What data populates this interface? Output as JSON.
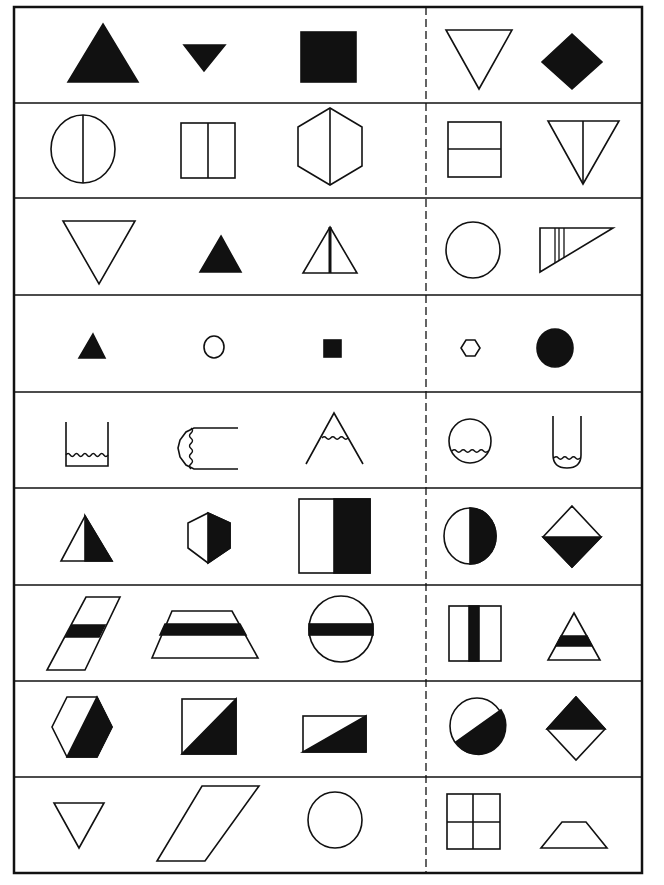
{
  "ink_color": "#111111",
  "paper_color": "#ffffff",
  "divider": {
    "style": "dashed",
    "separates": "group-of-three from group-of-two"
  },
  "rows": [
    {
      "theme": "solid shapes",
      "left": [
        {
          "shape": "triangle-up",
          "fill": "solid"
        },
        {
          "shape": "triangle-down-small",
          "fill": "solid"
        },
        {
          "shape": "rectangle",
          "fill": "solid"
        }
      ],
      "right": [
        {
          "shape": "triangle-down",
          "fill": "outline"
        },
        {
          "shape": "diamond",
          "fill": "solid"
        }
      ]
    },
    {
      "theme": "shapes split by a vertical line",
      "left": [
        {
          "shape": "ellipse",
          "fill": "outline",
          "divider": "vertical"
        },
        {
          "shape": "rectangle",
          "fill": "outline",
          "divider": "vertical"
        },
        {
          "shape": "hexagon",
          "fill": "outline",
          "divider": "vertical"
        }
      ],
      "right": [
        {
          "shape": "square",
          "fill": "outline",
          "divider": "horizontal"
        },
        {
          "shape": "triangle-down",
          "fill": "outline",
          "divider": "vertical"
        }
      ]
    },
    {
      "theme": "triangles",
      "left": [
        {
          "shape": "triangle-down",
          "fill": "outline"
        },
        {
          "shape": "triangle-up",
          "fill": "solid"
        },
        {
          "shape": "triangle-up",
          "fill": "outline",
          "divider": "vertical-bold"
        }
      ],
      "right": [
        {
          "shape": "ellipse",
          "fill": "outline"
        },
        {
          "shape": "right-triangle",
          "fill": "outline",
          "divider": "three-vertical-lines"
        }
      ]
    },
    {
      "theme": "small shapes",
      "left": [
        {
          "shape": "triangle-up",
          "fill": "solid",
          "size": "small"
        },
        {
          "shape": "ellipse",
          "fill": "outline",
          "size": "small"
        },
        {
          "shape": "square",
          "fill": "solid",
          "size": "small"
        }
      ],
      "right": [
        {
          "shape": "hexagon",
          "fill": "outline",
          "size": "small"
        },
        {
          "shape": "ellipse",
          "fill": "solid"
        }
      ]
    },
    {
      "theme": "open containers with wavy liquid",
      "left": [
        {
          "shape": "cup-square",
          "fill": "wavy-liquid"
        },
        {
          "shape": "tube-sideways",
          "fill": "wavy-liquid"
        },
        {
          "shape": "open-triangle",
          "fill": "wavy-liquid"
        }
      ],
      "right": [
        {
          "shape": "circle",
          "fill": "wavy-liquid"
        },
        {
          "shape": "test-tube",
          "fill": "wavy-liquid"
        }
      ]
    },
    {
      "theme": "shapes half-filled vertically",
      "left": [
        {
          "shape": "triangle-up",
          "fill": "right-half"
        },
        {
          "shape": "hexagon",
          "fill": "right-half"
        },
        {
          "shape": "rectangle",
          "fill": "right-half"
        }
      ],
      "right": [
        {
          "shape": "ellipse",
          "fill": "right-half"
        },
        {
          "shape": "diamond",
          "fill": "bottom-half"
        }
      ]
    },
    {
      "theme": "shapes with a horizontal band",
      "left": [
        {
          "shape": "parallelogram",
          "fill": "horizontal-band"
        },
        {
          "shape": "trapezoid",
          "fill": "horizontal-band"
        },
        {
          "shape": "ellipse",
          "fill": "horizontal-band"
        }
      ],
      "right": [
        {
          "shape": "square",
          "fill": "vertical-band"
        },
        {
          "shape": "triangle-up",
          "fill": "horizontal-band"
        }
      ]
    },
    {
      "theme": "shapes half-filled diagonally",
      "left": [
        {
          "shape": "hexagon",
          "fill": "diagonal-half"
        },
        {
          "shape": "square",
          "fill": "diagonal-half"
        },
        {
          "shape": "rectangle",
          "fill": "diagonal-half"
        }
      ],
      "right": [
        {
          "shape": "ellipse",
          "fill": "diagonal-half"
        },
        {
          "shape": "diamond",
          "fill": "top-half"
        }
      ]
    },
    {
      "theme": "plain outlines",
      "left": [
        {
          "shape": "triangle-down",
          "fill": "outline"
        },
        {
          "shape": "parallelogram",
          "fill": "outline"
        },
        {
          "shape": "ellipse",
          "fill": "outline"
        }
      ],
      "right": [
        {
          "shape": "square",
          "fill": "outline",
          "divider": "cross"
        },
        {
          "shape": "trapezoid",
          "fill": "outline"
        }
      ]
    }
  ]
}
